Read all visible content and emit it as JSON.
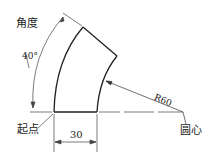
{
  "diagram": {
    "labels": {
      "angle_title": "角度",
      "angle_value": "40°",
      "start_point": "起点",
      "width_dim": "30",
      "radius_dim": "R60",
      "center": "圆心"
    },
    "colors": {
      "line": "#222222",
      "background": "#ffffff"
    }
  }
}
